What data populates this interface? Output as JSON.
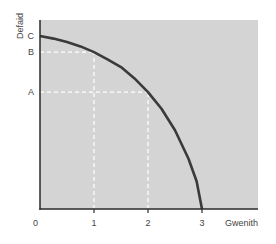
{
  "chart_data": {
    "type": "line",
    "title": "",
    "xlabel": "Gwenith",
    "ylabel": "Defaid",
    "xlim": [
      0,
      3.6
    ],
    "ylim": [
      0,
      1.09
    ],
    "x_ticks": [
      {
        "value": 0,
        "label": "0"
      },
      {
        "value": 1,
        "label": "1"
      },
      {
        "value": 2,
        "label": "2"
      },
      {
        "value": 3,
        "label": "3"
      }
    ],
    "y_ticks": [
      {
        "value": 0.676,
        "label": "A"
      },
      {
        "value": 0.907,
        "label": "B"
      },
      {
        "value": 1.0,
        "label": "C"
      }
    ],
    "series": [
      {
        "name": "production-possibility-frontier",
        "color": "#3a3a3a",
        "x": [
          0,
          0.25,
          0.5,
          0.75,
          1.0,
          1.25,
          1.5,
          1.75,
          2.0,
          2.25,
          2.5,
          2.75,
          2.9,
          3.0
        ],
        "y": [
          1.0,
          0.985,
          0.965,
          0.94,
          0.907,
          0.865,
          0.82,
          0.755,
          0.676,
          0.58,
          0.455,
          0.29,
          0.16,
          0.0
        ]
      }
    ],
    "reference_lines": [
      {
        "name": "guide-b-horizontal",
        "from": [
          0,
          0.907
        ],
        "to": [
          1,
          0.907
        ]
      },
      {
        "name": "guide-1-vertical",
        "from": [
          1,
          0
        ],
        "to": [
          1,
          0.907
        ]
      },
      {
        "name": "guide-a-horizontal",
        "from": [
          0,
          0.676
        ],
        "to": [
          2,
          0.676
        ]
      },
      {
        "name": "guide-2-vertical",
        "from": [
          2,
          0
        ],
        "to": [
          2,
          0.676
        ]
      }
    ],
    "grid": false,
    "legend": "none",
    "colors": {
      "plot_background": "#d4d4d4",
      "axis": "#2a2a2a",
      "guide": "#ffffff"
    }
  }
}
